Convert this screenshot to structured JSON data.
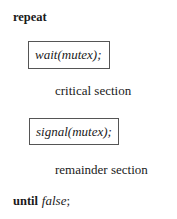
{
  "code": {
    "repeat_keyword": "repeat",
    "entry": {
      "func": "wait",
      "open": "(",
      "arg": "mutex",
      "close": ");"
    },
    "critical_section": "critical section",
    "exit": {
      "func": "signal",
      "open": "(",
      "arg": "mutex",
      "close": ");"
    },
    "remainder_section": "remainder section",
    "until_keyword": "until",
    "until_condition": "false",
    "until_terminator": ";"
  }
}
